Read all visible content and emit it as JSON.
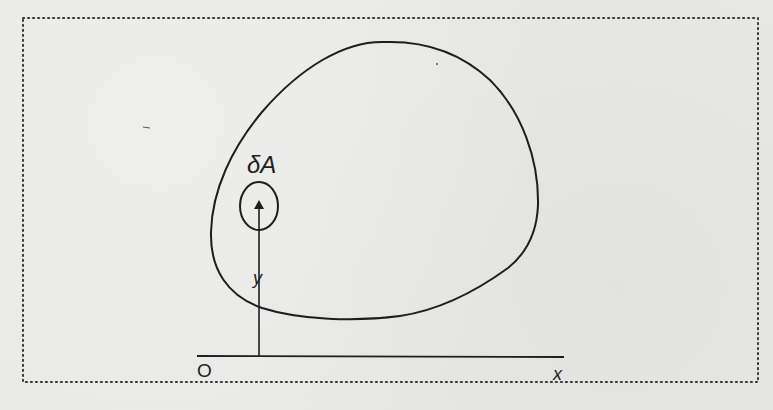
{
  "figure": {
    "labels": {
      "element_area": "δA",
      "distance": "y",
      "origin": "O",
      "axis_x": "x"
    },
    "colors": {
      "paper": "#e8e8e6",
      "ink": "#1e1e1e",
      "frame_dots": "#3a3a3a"
    },
    "geometry": {
      "frame": {
        "x": 22,
        "y": 18,
        "width": 737,
        "height": 364
      },
      "x_axis": {
        "x1": 197,
        "y1": 356,
        "x2": 564,
        "y2": 357
      },
      "y_arrow": {
        "x": 259,
        "y_from": 356,
        "y_to": 203
      },
      "element_ellipse": {
        "cx": 259,
        "cy": 206,
        "rx": 19,
        "ry": 24
      },
      "region": "closed convex blob centered near (400,190)"
    }
  }
}
